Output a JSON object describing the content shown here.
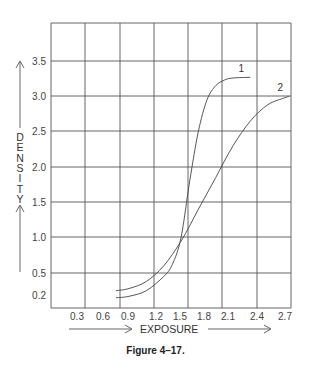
{
  "chart_data": {
    "type": "line",
    "title": "",
    "caption": "Figure 4–17.",
    "xlabel": "EXPOSURE",
    "ylabel": "DENSITY",
    "x_ticks": [
      "0.3",
      "0.6",
      "0.9",
      "1.2",
      "1.5",
      "1.8",
      "2.1",
      "2.4",
      "2.7"
    ],
    "y_ticks": [
      "0.2",
      "0.5",
      "1.0",
      "1.5",
      "2.0",
      "2.5",
      "3.0",
      "3.5"
    ],
    "xlim": [
      0,
      2.8
    ],
    "ylim": [
      0,
      4.0
    ],
    "grid": true,
    "legend": "inline labels at curve ends",
    "series": [
      {
        "name": "1",
        "x": [
          0.75,
          0.9,
          1.1,
          1.3,
          1.4,
          1.5,
          1.6,
          1.7,
          1.8,
          1.9,
          2.0,
          2.1,
          2.3
        ],
        "y": [
          0.15,
          0.17,
          0.25,
          0.45,
          0.62,
          1.0,
          1.8,
          2.5,
          2.95,
          3.15,
          3.23,
          3.26,
          3.27
        ]
      },
      {
        "name": "2",
        "x": [
          0.75,
          0.9,
          1.1,
          1.3,
          1.5,
          1.7,
          1.9,
          2.1,
          2.3,
          2.5,
          2.7,
          2.75
        ],
        "y": [
          0.25,
          0.28,
          0.38,
          0.6,
          0.95,
          1.4,
          1.85,
          2.3,
          2.65,
          2.88,
          2.98,
          3.0
        ]
      }
    ]
  },
  "figure": {
    "caption": "Figure 4–17.",
    "xlabel": "EXPOSURE",
    "ylabel_letters": [
      "D",
      "E",
      "N",
      "S",
      "I",
      "T",
      "Y"
    ]
  }
}
